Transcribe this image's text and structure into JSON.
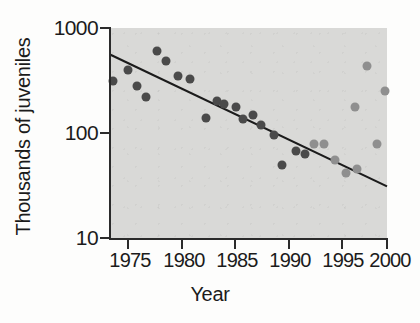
{
  "chart_data": {
    "type": "scatter",
    "title": "",
    "xlabel": "Year",
    "ylabel": "Thousands of juveniles",
    "xlim": [
      1973.3,
      2000.0
    ],
    "ylim": [
      10,
      1000
    ],
    "yscale": "log",
    "grid": false,
    "legend": "none",
    "xticks": [
      1975,
      1980,
      1985,
      1990,
      1995,
      2000
    ],
    "xtick_labels": [
      "1975",
      "1980",
      "1985",
      "1990",
      "1995",
      "2000"
    ],
    "yticks": [
      10,
      100,
      1000
    ],
    "ytick_labels": [
      "10",
      "100",
      "1000"
    ],
    "plot_background": "#d9d9d7",
    "series": [
      {
        "name": "dark-points",
        "color": "#4a4a4a",
        "marker": "circle",
        "marker_size": 9,
        "points": [
          {
            "x": 1973.6,
            "y": 310
          },
          {
            "x": 1975.0,
            "y": 400
          },
          {
            "x": 1975.9,
            "y": 280
          },
          {
            "x": 1976.8,
            "y": 220
          },
          {
            "x": 1977.8,
            "y": 600
          },
          {
            "x": 1978.7,
            "y": 480
          },
          {
            "x": 1979.9,
            "y": 350
          },
          {
            "x": 1981.0,
            "y": 330
          },
          {
            "x": 1982.6,
            "y": 140
          },
          {
            "x": 1983.6,
            "y": 200
          },
          {
            "x": 1984.3,
            "y": 190
          },
          {
            "x": 1985.4,
            "y": 175
          },
          {
            "x": 1986.1,
            "y": 135
          },
          {
            "x": 1987.1,
            "y": 150
          },
          {
            "x": 1987.9,
            "y": 118
          },
          {
            "x": 1989.1,
            "y": 95
          },
          {
            "x": 1989.9,
            "y": 50
          },
          {
            "x": 1991.2,
            "y": 68
          },
          {
            "x": 1992.1,
            "y": 63
          }
        ]
      },
      {
        "name": "light-points",
        "color": "#8f8f8f",
        "marker": "circle",
        "marker_size": 9,
        "points": [
          {
            "x": 1993.0,
            "y": 78
          },
          {
            "x": 1993.9,
            "y": 78
          },
          {
            "x": 1995.0,
            "y": 55
          },
          {
            "x": 1996.0,
            "y": 42
          },
          {
            "x": 1996.9,
            "y": 175
          },
          {
            "x": 1997.1,
            "y": 45
          },
          {
            "x": 1998.1,
            "y": 430
          },
          {
            "x": 1999.0,
            "y": 78
          },
          {
            "x": 1999.8,
            "y": 250
          }
        ]
      }
    ],
    "trendline": {
      "name": "regression-line",
      "color": "#1b1b1b",
      "x_start": 1973.3,
      "y_start": 560,
      "x_end": 2000.0,
      "y_end": 31
    }
  },
  "axes": {
    "ylabel": "Thousands of juveniles",
    "xlabel": "Year",
    "ytick_labels": [
      "1000",
      "100",
      "10"
    ],
    "xtick_labels": [
      "1975",
      "1980",
      "1985",
      "1990",
      "1995",
      "2000"
    ]
  }
}
